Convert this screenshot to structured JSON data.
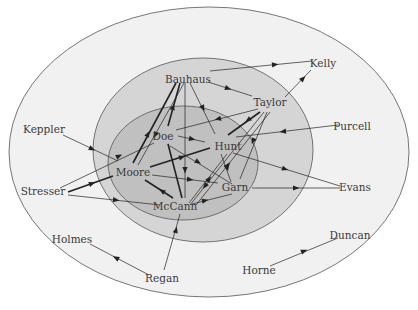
{
  "diagram": {
    "type": "concentric sociogram",
    "rings": [
      {
        "name": "outer",
        "cx": 209,
        "cy": 152,
        "rx": 200,
        "ry": 145,
        "fill": "#f1f1f1"
      },
      {
        "name": "middle",
        "cx": 203,
        "cy": 150,
        "rx": 110,
        "ry": 92,
        "fill": "#d5d5d5"
      },
      {
        "name": "inner",
        "cx": 183,
        "cy": 163,
        "rx": 75,
        "ry": 57,
        "fill": "#c0c0c0"
      }
    ],
    "nodes": [
      {
        "id": "kelly",
        "label": "Kelly",
        "x": 323,
        "y": 67,
        "ring": "outer"
      },
      {
        "id": "bauhaus",
        "label": "Bauhaus",
        "x": 188,
        "y": 83,
        "ring": "middle"
      },
      {
        "id": "taylor",
        "label": "Taylor",
        "x": 270,
        "y": 106,
        "ring": "middle"
      },
      {
        "id": "purcell",
        "label": "Purcell",
        "x": 352,
        "y": 130,
        "ring": "outer"
      },
      {
        "id": "keppler",
        "label": "Keppler",
        "x": 44,
        "y": 133,
        "ring": "outer"
      },
      {
        "id": "doe",
        "label": "Doe",
        "x": 163,
        "y": 140,
        "ring": "inner"
      },
      {
        "id": "hunt",
        "label": "Hunt",
        "x": 228,
        "y": 150,
        "ring": "inner"
      },
      {
        "id": "moore",
        "label": "Moore",
        "x": 133,
        "y": 176,
        "ring": "inner"
      },
      {
        "id": "stresser",
        "label": "Stresser",
        "x": 43,
        "y": 195,
        "ring": "outer"
      },
      {
        "id": "garn",
        "label": "Garn",
        "x": 235,
        "y": 191,
        "ring": "inner"
      },
      {
        "id": "evans",
        "label": "Evans",
        "x": 355,
        "y": 191,
        "ring": "outer"
      },
      {
        "id": "mccann",
        "label": "McCann",
        "x": 175,
        "y": 210,
        "ring": "inner"
      },
      {
        "id": "holmes",
        "label": "Holmes",
        "x": 72,
        "y": 243,
        "ring": "outer"
      },
      {
        "id": "duncan",
        "label": "Duncan",
        "x": 350,
        "y": 239,
        "ring": "outer"
      },
      {
        "id": "horne",
        "label": "Horne",
        "x": 259,
        "y": 274,
        "ring": "outer"
      },
      {
        "id": "regan",
        "label": "Regan",
        "x": 162,
        "y": 282,
        "ring": "outer"
      }
    ],
    "edges": [
      {
        "x1": 210,
        "y1": 71,
        "x2": 312,
        "y2": 61,
        "ax": 275,
        "ay": 64.5,
        "dir": 1,
        "thick": false
      },
      {
        "x1": 285,
        "y1": 97,
        "x2": 311,
        "y2": 70,
        "ax": 303,
        "ay": 78.5,
        "dir": 1,
        "thick": false
      },
      {
        "x1": 252,
        "y1": 96,
        "x2": 208,
        "y2": 82,
        "ax": 228,
        "ay": 88.5,
        "dir": -1,
        "thick": false
      },
      {
        "x1": 176,
        "y1": 83,
        "x2": 133,
        "y2": 163,
        "ax": 148,
        "ay": 134,
        "dir": -1,
        "thick": true
      },
      {
        "x1": 180,
        "y1": 83,
        "x2": 168,
        "y2": 126,
        "ax": 173,
        "ay": 107,
        "dir": -1,
        "thick": true
      },
      {
        "x1": 184,
        "y1": 83,
        "x2": 138,
        "y2": 165,
        "ax": 155,
        "ay": 135,
        "dir": 1,
        "thick": false
      },
      {
        "x1": 185,
        "y1": 83,
        "x2": 185,
        "y2": 198,
        "ax": 185,
        "ay": 170,
        "dir": 1,
        "thick": false
      },
      {
        "x1": 190,
        "y1": 83,
        "x2": 215,
        "y2": 134,
        "ax": 203,
        "ay": 108,
        "dir": 1,
        "thick": false
      },
      {
        "x1": 258,
        "y1": 109,
        "x2": 176,
        "y2": 130,
        "ax": 218,
        "ay": 119,
        "dir": 1,
        "thick": false
      },
      {
        "x1": 260,
        "y1": 112,
        "x2": 228,
        "y2": 135,
        "ax": 248,
        "ay": 120,
        "dir": 1,
        "thick": true
      },
      {
        "x1": 264,
        "y1": 112,
        "x2": 190,
        "y2": 205,
        "ax": 205,
        "ay": 186,
        "dir": 1,
        "thick": false
      },
      {
        "x1": 267,
        "y1": 112,
        "x2": 240,
        "y2": 179,
        "ax": 253,
        "ay": 141,
        "dir": 1,
        "thick": false
      },
      {
        "x1": 270,
        "y1": 112,
        "x2": 196,
        "y2": 205,
        "ax": 228,
        "ay": 165,
        "dir": -1,
        "thick": false
      },
      {
        "x1": 338,
        "y1": 125,
        "x2": 236,
        "y2": 137,
        "ax": 283,
        "ay": 131.5,
        "dir": 1,
        "thick": false
      },
      {
        "x1": 63,
        "y1": 135,
        "x2": 118,
        "y2": 161,
        "ax": 92,
        "ay": 149,
        "dir": 1,
        "thick": false
      },
      {
        "x1": 60,
        "y1": 188,
        "x2": 154,
        "y2": 143,
        "ax": 119,
        "ay": 156,
        "dir": 1,
        "thick": false
      },
      {
        "x1": 68,
        "y1": 192,
        "x2": 113,
        "y2": 176,
        "ax": 92,
        "ay": 183.5,
        "dir": 1,
        "thick": true
      },
      {
        "x1": 68,
        "y1": 195,
        "x2": 160,
        "y2": 205,
        "ax": 116,
        "ay": 200,
        "dir": 1,
        "thick": false
      },
      {
        "x1": 178,
        "y1": 136,
        "x2": 205,
        "y2": 142,
        "ax": 192,
        "ay": 139,
        "dir": 1,
        "thick": false
      },
      {
        "x1": 170,
        "y1": 146,
        "x2": 232,
        "y2": 184,
        "ax": 198,
        "ay": 162,
        "dir": 1,
        "thick": false
      },
      {
        "x1": 168,
        "y1": 144,
        "x2": 182,
        "y2": 198,
        "ax": 176,
        "ay": 175,
        "dir": 0,
        "thick": true
      },
      {
        "x1": 150,
        "y1": 167,
        "x2": 210,
        "y2": 148,
        "ax": 182,
        "ay": 157,
        "dir": 1,
        "thick": true
      },
      {
        "x1": 152,
        "y1": 175,
        "x2": 218,
        "y2": 183,
        "ax": 190,
        "ay": 179.5,
        "dir": 1,
        "thick": false
      },
      {
        "x1": 145,
        "y1": 180,
        "x2": 173,
        "y2": 198,
        "ax": 162,
        "ay": 191,
        "dir": -1,
        "thick": true
      },
      {
        "x1": 233,
        "y1": 153,
        "x2": 340,
        "y2": 186,
        "ax": 285,
        "ay": 169,
        "dir": 1,
        "thick": false
      },
      {
        "x1": 227,
        "y1": 154,
        "x2": 189,
        "y2": 203,
        "ax": 209,
        "ay": 179,
        "dir": -1,
        "thick": false
      },
      {
        "x1": 221,
        "y1": 154,
        "x2": 231,
        "y2": 182,
        "ax": 227,
        "ay": 168,
        "dir": 1,
        "thick": false
      },
      {
        "x1": 232,
        "y1": 194,
        "x2": 192,
        "y2": 204,
        "ax": 205,
        "ay": 200.5,
        "dir": -1,
        "thick": false
      },
      {
        "x1": 252,
        "y1": 188,
        "x2": 340,
        "y2": 188,
        "ax": 296,
        "ay": 188,
        "dir": 1,
        "thick": false
      },
      {
        "x1": 164,
        "y1": 270,
        "x2": 180,
        "y2": 214,
        "ax": 176,
        "ay": 230,
        "dir": 1,
        "thick": false
      },
      {
        "x1": 149,
        "y1": 275,
        "x2": 90,
        "y2": 244,
        "ax": 116,
        "ay": 258,
        "dir": 1,
        "thick": false
      },
      {
        "x1": 270,
        "y1": 266,
        "x2": 338,
        "y2": 238,
        "ax": 304,
        "ay": 251,
        "dir": 1,
        "thick": false
      }
    ],
    "colors": {
      "background": "#ffffff",
      "ring_stroke": "#555555",
      "edge": "#222222",
      "label": "#3a3a3a"
    }
  }
}
